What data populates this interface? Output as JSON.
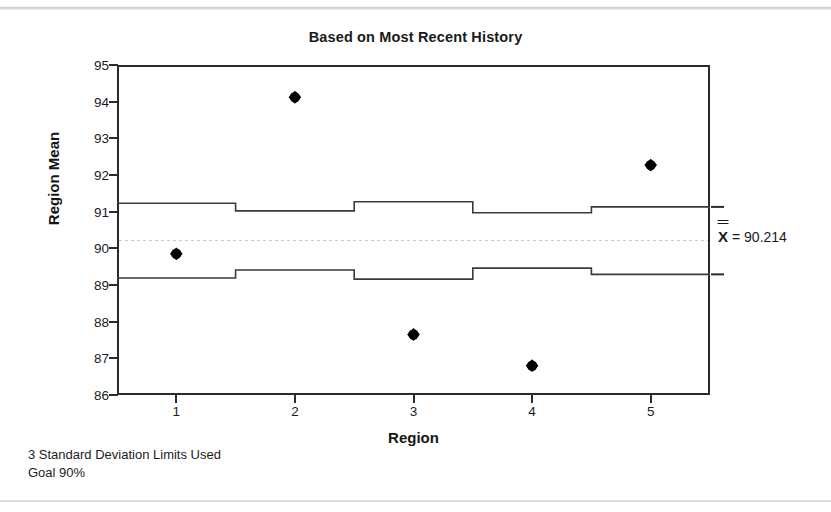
{
  "chart_data": {
    "type": "scatter",
    "title": "Based on Most Recent History",
    "xlabel": "Region",
    "ylabel": "Region Mean",
    "categories": [
      "1",
      "2",
      "3",
      "4",
      "5"
    ],
    "x": [
      1,
      2,
      3,
      4,
      5
    ],
    "values": [
      89.85,
      94.12,
      87.65,
      86.8,
      92.27
    ],
    "series": [
      {
        "name": "Region Mean",
        "values": [
          89.85,
          94.12,
          87.65,
          86.8,
          92.27
        ]
      },
      {
        "name": "Upper Control Limit",
        "values": [
          91.23,
          91.02,
          91.27,
          90.97,
          91.13
        ]
      },
      {
        "name": "Lower Control Limit",
        "values": [
          89.19,
          89.41,
          89.16,
          89.46,
          89.29
        ]
      },
      {
        "name": "Center Line",
        "values": [
          90.214,
          90.214,
          90.214,
          90.214,
          90.214
        ]
      }
    ],
    "center_line": 90.214,
    "xlim": [
      0.5,
      5.5
    ],
    "ylim": [
      86,
      95
    ],
    "yticks": [
      86,
      87,
      88,
      89,
      90,
      91,
      92,
      93,
      94,
      95
    ],
    "xticks": [
      1,
      2,
      3,
      4,
      5
    ],
    "grid": false,
    "legend": "none",
    "annotations": [
      {
        "text": "X = 90.214",
        "value": 90.214,
        "position": "right-of-axis"
      }
    ],
    "colors": {
      "marker": "#000000",
      "limit_line": "#3a3a3a",
      "center_line": "#c8c8c8",
      "axis": "#2b2b2b",
      "text": "#1a1a1a"
    }
  },
  "title": "Based on Most Recent History",
  "axes": {
    "y_title": "Region Mean",
    "x_title": "Region",
    "y_ticks": [
      "95",
      "94",
      "93",
      "92",
      "91",
      "90",
      "89",
      "88",
      "87",
      "86"
    ],
    "x_ticks": [
      "1",
      "2",
      "3",
      "4",
      "5"
    ]
  },
  "annotation": {
    "mean_symbol": "X",
    "mean_text": "= 90.214",
    "mean_value": "90.214"
  },
  "footnotes": {
    "line1": "3 Standard Deviation Limits Used",
    "line2": "Goal 90%"
  }
}
